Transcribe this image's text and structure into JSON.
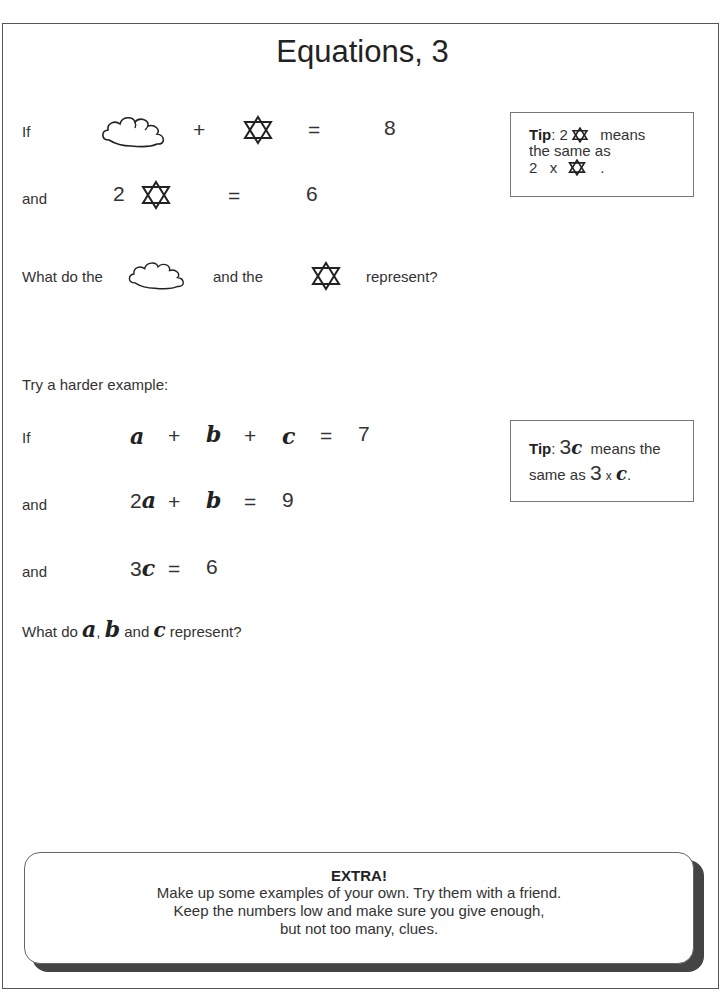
{
  "page": {
    "title": "Equations, 3"
  },
  "part1": {
    "eq1": {
      "prefix": "If",
      "plus": "+",
      "equals": "=",
      "result": "8",
      "symbols": [
        "cloud",
        "star"
      ]
    },
    "eq2": {
      "prefix": "and",
      "coefficient": "2",
      "equals": "=",
      "result": "6",
      "symbols": [
        "star"
      ]
    },
    "question": {
      "before": "What do the",
      "middle": "and the",
      "after": "represent?"
    },
    "tip": {
      "label": "Tip",
      "colon": ":",
      "coef": "2",
      "means": "means",
      "line2": "the same as",
      "line3_num": "2",
      "line3_times": "x",
      "line3_end": "."
    }
  },
  "part2": {
    "intro": "Try a harder example:",
    "eq1": {
      "prefix": "If",
      "a": "a",
      "plus1": "+",
      "b": "b",
      "plus2": "+",
      "c": "c",
      "equals": "=",
      "result": "7"
    },
    "eq2": {
      "prefix": "and",
      "coef": "2",
      "a": "a",
      "plus": "+",
      "b": "b",
      "equals": "=",
      "result": "9"
    },
    "eq3": {
      "prefix": "and",
      "coef": "3",
      "c": "c",
      "equals": "=",
      "result": "6"
    },
    "question": {
      "before": "What do",
      "a": "a",
      "comma": ",",
      "b": "b",
      "and": "and",
      "c": "c",
      "after": "represent?"
    },
    "tip": {
      "label": "Tip",
      "colon": ":",
      "coef": "3",
      "var": "c",
      "means": "means the",
      "line2": "same as",
      "line2_num": "3",
      "line2_times": "x",
      "line2_var": "c",
      "line2_end": "."
    }
  },
  "extra": {
    "title": "EXTRA!",
    "lines": [
      "Make up some examples of your own. Try them with a friend.",
      "Keep the numbers low and make sure you give enough,",
      "but not too many, clues."
    ]
  }
}
